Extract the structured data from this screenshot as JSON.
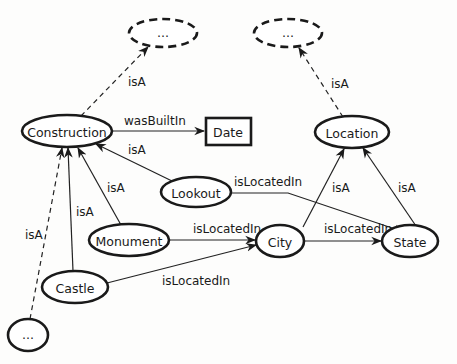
{
  "diagram": {
    "type": "ontology-graph",
    "nodes": {
      "top_left_more": {
        "label": "...",
        "style": "dashed-ellipse"
      },
      "top_right_more": {
        "label": "...",
        "style": "dashed-ellipse"
      },
      "construction": {
        "label": "Construction",
        "style": "ellipse"
      },
      "date": {
        "label": "Date",
        "style": "rectangle"
      },
      "location": {
        "label": "Location",
        "style": "ellipse"
      },
      "lookout": {
        "label": "Lookout",
        "style": "ellipse"
      },
      "monument": {
        "label": "Monument",
        "style": "ellipse"
      },
      "city": {
        "label": "City",
        "style": "ellipse"
      },
      "state": {
        "label": "State",
        "style": "ellipse"
      },
      "castle": {
        "label": "Castle",
        "style": "ellipse"
      },
      "bottom_left_more": {
        "label": "...",
        "style": "ellipse"
      }
    },
    "edges": {
      "construction_isa_more": {
        "from": "Construction",
        "to": "...",
        "label": "isA",
        "style": "dashed"
      },
      "location_isa_more": {
        "from": "Location",
        "to": "...",
        "label": "isA",
        "style": "dashed"
      },
      "construction_wasbuiltin_date": {
        "from": "Construction",
        "to": "Date",
        "label": "wasBuiltIn",
        "style": "solid"
      },
      "lookout_isa_construction": {
        "from": "Lookout",
        "to": "Construction",
        "label": "isA",
        "style": "solid"
      },
      "monument_isa_construction": {
        "from": "Monument",
        "to": "Construction",
        "label": "isA",
        "style": "solid"
      },
      "castle_isa_construction": {
        "from": "Castle",
        "to": "Construction",
        "label": "isA",
        "style": "solid"
      },
      "more_isa_construction": {
        "from": "...",
        "to": "Construction",
        "label": "isA",
        "style": "dashed"
      },
      "lookout_islocatedin_state": {
        "from": "Lookout",
        "to": "State",
        "label": "isLocatedIn",
        "style": "solid"
      },
      "monument_islocatedin_city": {
        "from": "Monument",
        "to": "City",
        "label": "isLocatedIn",
        "style": "solid"
      },
      "castle_islocatedin_city": {
        "from": "Castle",
        "to": "City",
        "label": "isLocatedIn",
        "style": "solid"
      },
      "city_islocatedin_state": {
        "from": "City",
        "to": "State",
        "label": "isLocatedIn",
        "style": "solid"
      },
      "city_isa_location": {
        "from": "City",
        "to": "Location",
        "label": "isA",
        "style": "solid"
      },
      "state_isa_location": {
        "from": "State",
        "to": "Location",
        "label": "isA",
        "style": "solid"
      }
    }
  }
}
